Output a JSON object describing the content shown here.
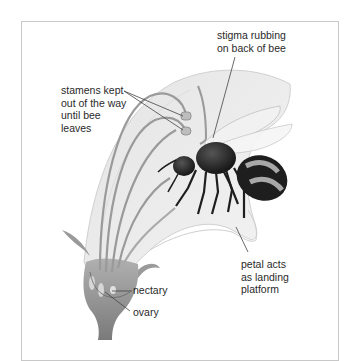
{
  "figure": {
    "labels": {
      "stigma": [
        "stigma rubbing",
        "on back of bee"
      ],
      "stamens": [
        "stamens kept",
        "out of the way",
        "until bee",
        "leaves"
      ],
      "petal": [
        "petal acts",
        "as landing",
        "platform"
      ],
      "nectary": "nectary",
      "ovary": "ovary"
    },
    "colors": {
      "frame": "#c8c8c8",
      "petal_fill": "#ececec",
      "petal_edge": "#d6d6d6",
      "flower_base": "#8c8c8c",
      "stamen": "#9a9a9a",
      "bee_body": "#1e1e1e",
      "bee_stripe": "#a8a8a8",
      "text": "#2a2a2a"
    }
  }
}
